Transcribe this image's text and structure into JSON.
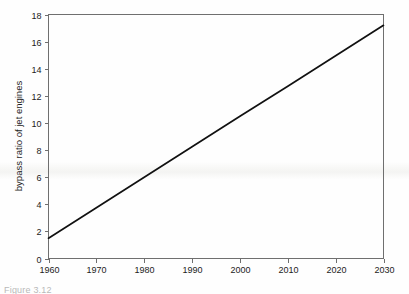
{
  "figure": {
    "caption": "Figure 3.12"
  },
  "chart_data": {
    "type": "line",
    "title": "",
    "xlabel": "",
    "ylabel": "bypass ratio of jet engines",
    "xlim": [
      1960,
      2030
    ],
    "ylim": [
      0,
      18
    ],
    "grid": false,
    "legend": null,
    "x_ticks": [
      1960,
      1970,
      1980,
      1990,
      2000,
      2010,
      2020,
      2030
    ],
    "y_ticks": [
      0,
      2,
      4,
      6,
      8,
      10,
      12,
      14,
      16,
      18
    ],
    "series": [
      {
        "name": "bypass ratio",
        "color": "#111111",
        "x": [
          1960,
          1970,
          1980,
          1990,
          2000,
          2010,
          2020,
          2030
        ],
        "values": [
          1.5,
          3.75,
          6.0,
          8.25,
          10.5,
          12.7,
          14.95,
          17.2
        ]
      }
    ]
  }
}
